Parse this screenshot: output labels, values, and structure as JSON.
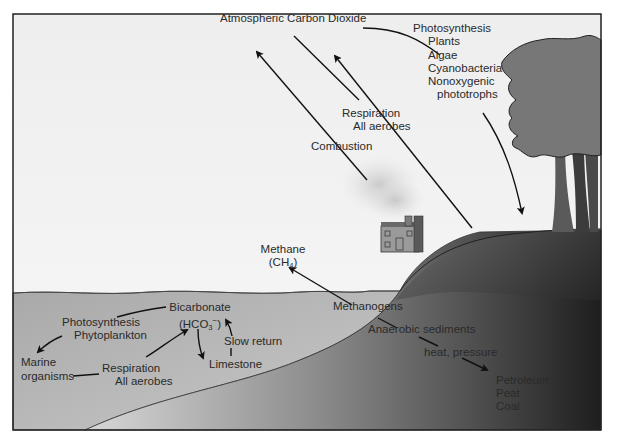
{
  "diagram": {
    "title_node": "Atmospheric Carbon Dioxide",
    "colors": {
      "sky": "#f2f2f2",
      "water": "#b8b8b8",
      "land_dark": "#3a3a3a",
      "frame": "#222222",
      "arrow": "#111111",
      "text": "#2a2a2a"
    },
    "land_processes": {
      "photosynthesis": {
        "title": "Photosynthesis",
        "organisms": [
          "Plants",
          "Algae",
          "Cyanobacteria",
          "Nonoxygenic",
          "phototrophs"
        ]
      },
      "respiration": {
        "title": "Respiration",
        "subtitle": "All aerobes"
      },
      "combustion": "Combustion"
    },
    "methane": {
      "name": "Methane",
      "formula_main": "(CH",
      "formula_sub": "4",
      "formula_end": ")"
    },
    "methanogens": "Methanogens",
    "anaerobic_sediments": "Anaerobic sediments",
    "heat_pressure": "heat, pressure",
    "fossil_fuels": [
      "Petroleum",
      "Peat",
      "Coal"
    ],
    "ocean": {
      "bicarbonate": {
        "name": "Bicarbonate",
        "formula_main": "(HCO",
        "formula_sub": "3",
        "formula_sup": "−",
        "formula_end": ")"
      },
      "photosynthesis": {
        "title": "Photosynthesis",
        "subtitle": "Phytoplankton"
      },
      "marine_organisms": {
        "line1": "Marine",
        "line2": "organisms"
      },
      "respiration": {
        "title": "Respiration",
        "subtitle": "All aerobes"
      },
      "limestone": "Limestone",
      "slow_return": "Slow return"
    },
    "flows": [
      {
        "from": "Combustion",
        "to": "Atmospheric Carbon Dioxide"
      },
      {
        "from": "Respiration (All aerobes)",
        "to": "Atmospheric Carbon Dioxide"
      },
      {
        "from": "Atmospheric Carbon Dioxide",
        "to": "Photosynthesis (land)"
      },
      {
        "from": "Methanogens",
        "to": "Methane"
      },
      {
        "from": "Anaerobic sediments",
        "to": "Petroleum / Peat / Coal",
        "via": "heat, pressure"
      },
      {
        "from": "Bicarbonate",
        "to": "Marine organisms",
        "via": "Photosynthesis (Phytoplankton)"
      },
      {
        "from": "Marine organisms",
        "to": "Bicarbonate",
        "via": "Respiration (All aerobes)"
      },
      {
        "from": "Bicarbonate",
        "to": "Limestone"
      },
      {
        "from": "Limestone",
        "to": "Bicarbonate",
        "via": "Slow return"
      }
    ]
  }
}
